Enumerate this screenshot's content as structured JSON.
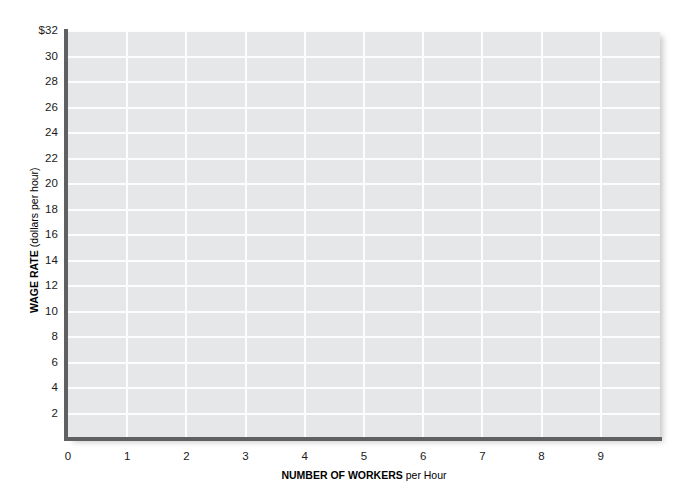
{
  "chart_data": {
    "type": "line",
    "title": "",
    "subtitle": "",
    "xlabel_bold": "NUMBER OF WORKERS",
    "xlabel_rest": " per Hour",
    "ylabel_bold": "WAGE RATE",
    "ylabel_rest": " (dollars per hour)",
    "xlim": [
      0,
      10
    ],
    "ylim": [
      0,
      32
    ],
    "x_ticks": [
      "0",
      "1",
      "2",
      "3",
      "4",
      "5",
      "6",
      "7",
      "8",
      "9"
    ],
    "x_tick_values": [
      0,
      1,
      2,
      3,
      4,
      5,
      6,
      7,
      8,
      9
    ],
    "y_ticks": [
      "$32",
      "30",
      "28",
      "26",
      "24",
      "22",
      "20",
      "18",
      "16",
      "14",
      "12",
      "10",
      "8",
      "6",
      "4",
      "2"
    ],
    "y_tick_values": [
      32,
      30,
      28,
      26,
      24,
      22,
      20,
      18,
      16,
      14,
      12,
      10,
      8,
      6,
      4,
      2
    ],
    "grid": true,
    "grid_color": "#ffffff",
    "plot_background": "#e6e7e8",
    "axis_color": "#606060",
    "legend": null,
    "legend_position": "none",
    "series": [],
    "annotations": []
  },
  "figure": {
    "background": "#ffffff",
    "width": 689,
    "height": 494
  }
}
